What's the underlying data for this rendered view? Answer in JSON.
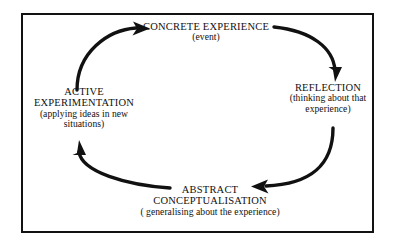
{
  "diagram": {
    "type": "cycle",
    "direction": "clockwise",
    "frame": {
      "border_color": "#121212",
      "background": "#ffffff"
    },
    "arrow_color": "#111111",
    "nodes": [
      {
        "id": "concrete-experience",
        "position": "top",
        "title": "CONCRETE EXPERIENCE",
        "subtitle": "(event)"
      },
      {
        "id": "reflection",
        "position": "right",
        "title": "REFLECTION",
        "subtitle_line1": "(thinking about that",
        "subtitle_line2": "experience)"
      },
      {
        "id": "abstract-conceptualisation",
        "position": "bottom",
        "title_line1": "ABSTRACT",
        "title_line2": "CONCEPTUALISATION",
        "subtitle": "( generalising about the experience)"
      },
      {
        "id": "active-experimentation",
        "position": "left",
        "title_line1": "ACTIVE",
        "title_line2": "EXPERIMENTATION",
        "subtitle_line1": "(applying ideas in new",
        "subtitle_line2": "situations)"
      }
    ],
    "arrows": [
      {
        "id": "arrow-concrete-to-reflection",
        "from": "concrete-experience",
        "to": "reflection"
      },
      {
        "id": "arrow-reflection-to-abstract",
        "from": "reflection",
        "to": "abstract-conceptualisation"
      },
      {
        "id": "arrow-abstract-to-active",
        "from": "abstract-conceptualisation",
        "to": "active-experimentation"
      },
      {
        "id": "arrow-active-to-concrete",
        "from": "active-experimentation",
        "to": "concrete-experience"
      }
    ]
  }
}
